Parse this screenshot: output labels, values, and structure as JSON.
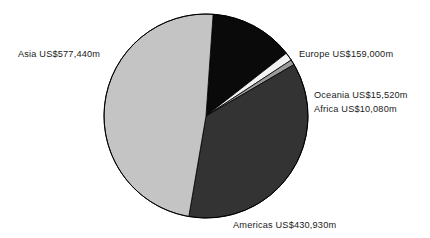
{
  "chart_data": {
    "type": "pie",
    "title": "",
    "subtitle": "",
    "xlabel": "",
    "ylabel": "",
    "legend_position": "none",
    "grid": false,
    "units": "US$ millions",
    "total": 1192970,
    "categories": [
      "Europe",
      "Oceania",
      "Africa",
      "Americas",
      "Asia"
    ],
    "values": [
      159000,
      15520,
      10080,
      430930,
      577440
    ],
    "labels": [
      "Europe US$159,000m",
      "Oceania US$15,520m",
      "Africa US$10,080m",
      "Americas US$430,930m",
      "Asia US$577,440m"
    ],
    "slices": [
      {
        "name": "Europe",
        "label": "Europe US$159,000m",
        "value": 159000,
        "value_text": "US$159,000m",
        "percent": 13.3,
        "color": "#0a0a0a",
        "start_angle": 4.0,
        "end_angle": 52.0
      },
      {
        "name": "Oceania",
        "label": "Oceania US$15,520m",
        "value": 15520,
        "value_text": "US$15,520m",
        "percent": 1.3,
        "color": "#f2f2f2",
        "start_angle": 52.0,
        "end_angle": 56.7
      },
      {
        "name": "Africa",
        "label": "Africa US$10,080m",
        "value": 10080,
        "value_text": "US$10,080m",
        "percent": 0.8,
        "color": "#9a9a9a",
        "start_angle": 56.7,
        "end_angle": 59.7
      },
      {
        "name": "Americas",
        "label": "Americas US$430,930m",
        "value": 430930,
        "value_text": "US$430,930m",
        "percent": 36.1,
        "color": "#333333",
        "start_angle": 59.7,
        "end_angle": 189.7
      },
      {
        "name": "Asia",
        "label": "Asia US$577,440m",
        "value": 577440,
        "value_text": "US$577,440m",
        "percent": 48.4,
        "color": "#c4c4c4",
        "start_angle": 189.7,
        "end_angle": 364.0
      }
    ],
    "geometry": {
      "center_x": 206,
      "center_y": 116,
      "radius": 102
    },
    "colors": {
      "background": "#ffffff",
      "text": "#1a1a1a",
      "outline": "#000000"
    }
  }
}
